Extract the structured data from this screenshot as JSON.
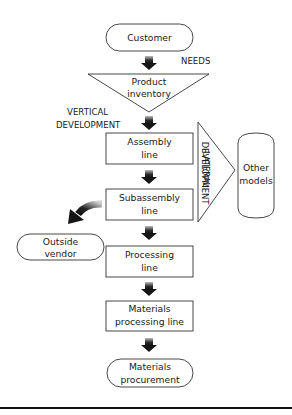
{
  "diagram": {
    "type": "production flow diagram",
    "nodes": {
      "customer": {
        "label": "Customer",
        "shape": "rounded"
      },
      "product_inventory": {
        "line1": "Product",
        "line2": "inventory",
        "shape": "inverted-triangle"
      },
      "assembly_line": {
        "line1": "Assembly",
        "line2": "line",
        "shape": "rectangle"
      },
      "subassembly_line": {
        "line1": "Subassembly",
        "line2": "line",
        "shape": "rectangle"
      },
      "processing_line": {
        "line1": "Processing",
        "line2": "line",
        "shape": "rectangle"
      },
      "materials_processing_line": {
        "line1": "Materials",
        "line2": "processing line",
        "shape": "rectangle"
      },
      "materials_procurement": {
        "line1": "Materials",
        "line2": "procurement",
        "shape": "rounded"
      },
      "outside_vendor": {
        "line1": "Outside",
        "line2": "vendor",
        "shape": "rounded"
      },
      "other_models": {
        "line1": "Other",
        "line2": "models",
        "shape": "cylinder"
      }
    },
    "annotations": {
      "needs": "NEEDS",
      "vertical_line1": "VERTICAL",
      "vertical_line2": "DEVELOPMENT",
      "lateral_line1": "LATERAL",
      "lateral_line2": "DEVELOPMENT"
    },
    "edges": [
      {
        "from": "Customer",
        "to": "Product inventory"
      },
      {
        "from": "Product inventory",
        "to": "Assembly line"
      },
      {
        "from": "Assembly line",
        "to": "Subassembly line"
      },
      {
        "from": "Subassembly line",
        "to": "Processing line"
      },
      {
        "from": "Subassembly line",
        "to": "Outside vendor",
        "style": "curved"
      },
      {
        "from": "Processing line",
        "to": "Materials processing line"
      },
      {
        "from": "Materials processing line",
        "to": "Materials procurement"
      },
      {
        "from": "Assembly/Subassembly",
        "to": "Other models",
        "label": "LATERAL DEVELOPMENT"
      }
    ],
    "colors": {
      "stroke": "#333333",
      "arrow": "#1a1a1a",
      "background": "#ffffff"
    }
  }
}
